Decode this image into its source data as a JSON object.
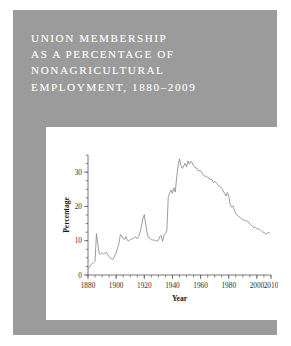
{
  "figure": {
    "title": "UNION MEMBERSHIP\nAS A PERCENTAGE OF\nNONAGRICULTURAL\nEMPLOYMENT, 1880–2009",
    "title_color": "#ffffff",
    "panel_color": "#9b9b9b",
    "plot_background": "#ffffff"
  },
  "chart_data": {
    "type": "line",
    "xlabel": "Year",
    "ylabel": "Percentage",
    "xlim": [
      1880,
      2010
    ],
    "ylim": [
      0,
      35
    ],
    "x_major_ticks": [
      1880,
      1900,
      1920,
      1940,
      1960,
      1980,
      2000,
      2010
    ],
    "x_major_tick_labels": [
      "1880",
      "1900",
      "1920",
      "1940",
      "1960",
      "1980",
      "2000",
      "2010"
    ],
    "x_minor_tick_step": 5,
    "y_ticks": [
      0,
      10,
      20,
      30
    ],
    "y_tick_labels": [
      "0",
      "10",
      "20",
      "30"
    ],
    "y_minor_tick_step": 2.5,
    "grid": false,
    "legend": false,
    "line_color": "#8a8b8f",
    "series": [
      {
        "name": "Union membership",
        "x": [
          1880,
          1881,
          1882,
          1883,
          1884,
          1885,
          1886,
          1887,
          1888,
          1889,
          1890,
          1891,
          1892,
          1893,
          1894,
          1895,
          1896,
          1897,
          1898,
          1899,
          1900,
          1901,
          1902,
          1903,
          1904,
          1905,
          1906,
          1907,
          1908,
          1909,
          1910,
          1911,
          1912,
          1913,
          1914,
          1915,
          1916,
          1917,
          1918,
          1919,
          1920,
          1921,
          1922,
          1923,
          1924,
          1925,
          1926,
          1927,
          1928,
          1929,
          1930,
          1931,
          1932,
          1933,
          1934,
          1935,
          1936,
          1937,
          1938,
          1939,
          1940,
          1941,
          1942,
          1943,
          1944,
          1945,
          1946,
          1947,
          1948,
          1949,
          1950,
          1951,
          1952,
          1953,
          1954,
          1955,
          1956,
          1957,
          1958,
          1959,
          1960,
          1961,
          1962,
          1963,
          1964,
          1965,
          1966,
          1967,
          1968,
          1969,
          1970,
          1971,
          1972,
          1973,
          1974,
          1975,
          1976,
          1977,
          1978,
          1979,
          1980,
          1981,
          1982,
          1983,
          1984,
          1985,
          1986,
          1987,
          1988,
          1989,
          1990,
          1991,
          1992,
          1993,
          1994,
          1995,
          1996,
          1997,
          1998,
          1999,
          2000,
          2001,
          2002,
          2003,
          2004,
          2005,
          2006,
          2007,
          2008,
          2009
        ],
        "values": [
          1.8,
          2.3,
          3.0,
          3.3,
          3.6,
          4.0,
          12.1,
          9.0,
          6.3,
          6.0,
          6.5,
          6.1,
          6.4,
          6.6,
          5.9,
          5.4,
          4.8,
          4.6,
          4.7,
          5.6,
          6.5,
          7.9,
          9.2,
          11.8,
          11.4,
          10.6,
          10.4,
          11.2,
          10.1,
          9.9,
          10.3,
          10.5,
          10.6,
          11.0,
          11.1,
          10.6,
          11.2,
          12.5,
          14.2,
          16.5,
          17.6,
          14.8,
          12.2,
          10.9,
          10.7,
          10.3,
          10.2,
          10.2,
          10.0,
          9.9,
          10.1,
          11.2,
          11.5,
          9.8,
          11.7,
          12.1,
          13.0,
          22.6,
          23.9,
          24.8,
          23.8,
          25.4,
          24.2,
          28.5,
          31.8,
          33.9,
          31.9,
          31.1,
          31.8,
          32.6,
          31.5,
          33.3,
          32.3,
          33.2,
          32.7,
          31.8,
          31.4,
          31.2,
          30.5,
          30.4,
          30.4,
          29.8,
          29.1,
          28.8,
          28.9,
          28.4,
          28.1,
          27.9,
          27.8,
          27.0,
          27.3,
          27.0,
          26.4,
          26.0,
          25.8,
          25.3,
          24.5,
          23.8,
          23.0,
          24.1,
          23.0,
          20.6,
          19.8,
          20.1,
          18.8,
          18.0,
          17.5,
          17.0,
          16.8,
          16.4,
          16.1,
          16.1,
          15.8,
          15.8,
          15.5,
          14.9,
          14.5,
          14.1,
          13.9,
          13.9,
          13.5,
          13.4,
          13.3,
          12.9,
          12.5,
          12.5,
          12.0,
          12.1,
          12.4,
          12.3
        ]
      }
    ]
  },
  "axes": {
    "x_title": "Year",
    "y_title": "Percentage"
  }
}
